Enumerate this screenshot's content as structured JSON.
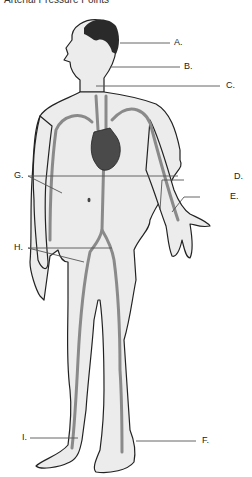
{
  "title": "Arterial Pressure Points",
  "labels": {
    "A": "A.",
    "B": "B.",
    "C": "C.",
    "D": "D.",
    "E": "E.",
    "F": "F.",
    "G": "G.",
    "H": "H.",
    "I": "I."
  },
  "colors": {
    "skin": "#ececec",
    "outline": "#222222",
    "artery": "#8a8a8a",
    "heart": "#4a4a4a",
    "hair": "#2a2a2a",
    "leader": "#555555"
  }
}
